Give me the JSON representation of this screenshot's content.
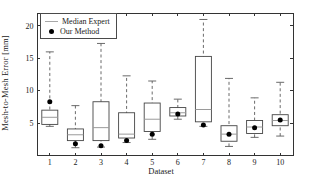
{
  "figure": {
    "background": "#ffffff"
  },
  "chart_data": {
    "type": "boxplot",
    "title": "",
    "xlabel": "Dataset",
    "ylabel": "Mesh-to-Mesh Error [mm]",
    "categories": [
      "1",
      "2",
      "3",
      "4",
      "5",
      "6",
      "7",
      "8",
      "9",
      "10"
    ],
    "ylim": [
      0,
      22
    ],
    "yticks": [
      5,
      10,
      15,
      20
    ],
    "grid": false,
    "legend_position": "top-left-inside",
    "legend": [
      {
        "label": "Median Expert",
        "symbol": "line",
        "color": "#a8a8a8"
      },
      {
        "label": "Our Method",
        "symbol": "dot",
        "color": "#000000"
      }
    ],
    "series": [
      {
        "name": "Median Expert",
        "type": "box",
        "stats": [
          {
            "lo": 4.5,
            "q1": 4.8,
            "med": 5.9,
            "q3": 7.0,
            "hi": 16.0
          },
          {
            "lo": 1.2,
            "q1": 2.3,
            "med": 3.2,
            "q3": 4.1,
            "hi": 7.7
          },
          {
            "lo": 1.3,
            "q1": 2.3,
            "med": 4.3,
            "q3": 8.3,
            "hi": 17.3
          },
          {
            "lo": 2.0,
            "q1": 2.7,
            "med": 3.3,
            "q3": 6.6,
            "hi": 12.3
          },
          {
            "lo": 2.5,
            "q1": 3.7,
            "med": 5.6,
            "q3": 8.1,
            "hi": 11.5
          },
          {
            "lo": 5.6,
            "q1": 6.1,
            "med": 6.6,
            "q3": 7.4,
            "hi": 8.7
          },
          {
            "lo": 4.5,
            "q1": 5.2,
            "med": 7.1,
            "q3": 15.3,
            "hi": 21.0
          },
          {
            "lo": 1.4,
            "q1": 2.2,
            "med": 3.3,
            "q3": 4.6,
            "hi": 11.9
          },
          {
            "lo": 2.8,
            "q1": 3.4,
            "med": 4.4,
            "q3": 5.4,
            "hi": 8.9
          },
          {
            "lo": 3.0,
            "q1": 4.6,
            "med": 5.4,
            "q3": 6.3,
            "hi": 11.3
          }
        ]
      },
      {
        "name": "Our Method",
        "type": "point",
        "values": [
          8.3,
          1.8,
          1.5,
          2.3,
          3.3,
          6.4,
          4.7,
          3.3,
          4.3,
          5.5
        ]
      }
    ],
    "colors": {
      "axis": "#333333",
      "box": "#454545",
      "whisker": "#5a5a5a",
      "median": "#9a9a9a",
      "marker": "#000000",
      "box_fill": "#ffffff"
    }
  }
}
